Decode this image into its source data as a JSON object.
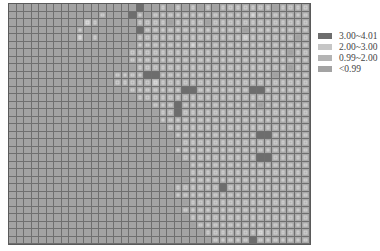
{
  "chart_data": {
    "type": "heatmap",
    "title": "",
    "xlabel": "",
    "ylabel": "",
    "grid": true,
    "legend_position": "right",
    "legend": [
      {
        "label": "3.00~4.01",
        "color": "#6d6d6d",
        "level": 3
      },
      {
        "label": "2.00~3.00",
        "color": "#c6c6c6",
        "level": 2
      },
      {
        "label": "0.99~2.00",
        "color": "#b4b4b4",
        "level": 1
      },
      {
        "label": "<0.99",
        "color": "#a3a3a3",
        "level": 0
      }
    ],
    "columns": 40,
    "rows": 32,
    "matrix_encoding": "each string is one row; each digit is the legend level of a cell (0=<0.99, 1=0.99~2.00, 2=2.00~3.00, 3=3.00~4.01)",
    "matrix": [
      "0000000000000000030010101010111111101111",
      "0000000000001000310111111111111121111111",
      "0000000000210000011110111101111111111111",
      "0000000001000000031111111111111011111111",
      "0000000002010000011111111111111211111101",
      "0000000000000000011111112111111111111111",
      "0000000000000000111111111111111111111011",
      "0000000000000000111111111111111111111111",
      "0000000000000000011111111111111111111011",
      "0000000000000011113311111111111111101111",
      "0000000000000011111211111111111111111111",
      "0000000000000000111111133111111133111111",
      "0000000000000000011111111111111111111111",
      "0000000000000000000111311111111110111111",
      "0000000000000000000011311111111111111111",
      "0000000000000000000011111111111111111111",
      "0000000000000000000001111111111111111111",
      "0000000000000000000000111111111113311111",
      "0000000000000000000000011111111111111111",
      "0000000000000000000000111111111111111111",
      "0000000000000000000000011111111113311111",
      "0000000000000000000000001111111111111111",
      "0000000000000000000000001111111111111111",
      "0000000000000000000000001111111111111111",
      "0000000000000000000000111111311111111111",
      "0000000000000000000000111111111111111111",
      "0000000000000000000000001111111111111111",
      "0000000000000000000000011111111111111111",
      "0000000000000000000000001111111111111111",
      "0000000000000000000000000111111111111111",
      "0000000000000000000000000011111112111111",
      "0000000000000000000000000001111131111111"
    ]
  }
}
